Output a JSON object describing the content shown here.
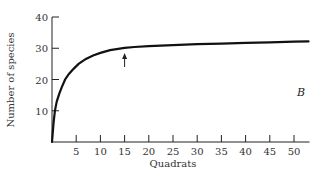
{
  "chart_data": {
    "type": "line",
    "title": "",
    "xlabel": "Quadrats",
    "ylabel": "Number of species",
    "xlim": [
      0,
      53
    ],
    "ylim": [
      0,
      40
    ],
    "xticks": [
      5,
      10,
      15,
      20,
      25,
      30,
      35,
      40,
      45,
      50
    ],
    "yticks": [
      10,
      20,
      30,
      40
    ],
    "grid": false,
    "panel_label": "B",
    "series": [
      {
        "name": "species-area curve",
        "x": [
          0,
          0.3,
          0.6,
          1,
          1.5,
          2,
          2.7,
          3.5,
          4.5,
          5.5,
          7,
          8.5,
          10,
          12,
          14,
          15,
          17,
          20,
          25,
          30,
          35,
          40,
          45,
          50,
          53
        ],
        "y": [
          0,
          6,
          10,
          13,
          15.5,
          17.5,
          20,
          21.8,
          23.5,
          25,
          26.6,
          27.7,
          28.5,
          29.4,
          29.9,
          30.1,
          30.4,
          30.7,
          31.0,
          31.3,
          31.5,
          31.7,
          31.9,
          32.1,
          32.2
        ]
      }
    ],
    "annotations": [
      {
        "type": "arrow",
        "x": 15,
        "y_from": 24,
        "y_to": 28.5,
        "direction": "up"
      }
    ]
  }
}
